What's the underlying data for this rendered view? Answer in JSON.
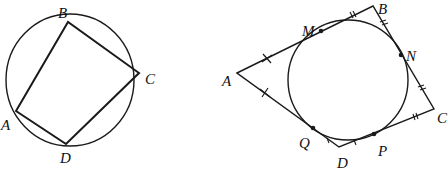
{
  "figures": [
    {
      "name": "cyclic-quadrilateral",
      "description": "Quadrilateral ABCD inscribed in a circle",
      "circle": {
        "cx": 70,
        "cy": 80,
        "rx": 64,
        "ry": 66
      },
      "vertices": {
        "A": {
          "x": 16,
          "y": 111
        },
        "B": {
          "x": 68,
          "y": 22
        },
        "C": {
          "x": 139,
          "y": 73
        },
        "D": {
          "x": 66,
          "y": 144
        }
      },
      "labels": {
        "A": "A",
        "B": "B",
        "C": "C",
        "D": "D"
      }
    },
    {
      "name": "tangential-quadrilateral",
      "description": "Quadrilateral ABCD circumscribed about a circle with tangent points M, N, P, Q; equal tangent segments marked with ticks",
      "circle": {
        "cx": 348,
        "cy": 80,
        "r": 60
      },
      "vertices": {
        "A": {
          "x": 237,
          "y": 73
        },
        "B": {
          "x": 373,
          "y": 6
        },
        "C": {
          "x": 434,
          "y": 109
        },
        "D": {
          "x": 339,
          "y": 147
        }
      },
      "tangent_points": {
        "M": {
          "x": 321,
          "y": 31
        },
        "N": {
          "x": 401,
          "y": 55
        },
        "P": {
          "x": 374,
          "y": 134
        },
        "Q": {
          "x": 313,
          "y": 128
        }
      },
      "labels": {
        "A": "A",
        "B": "B",
        "C": "C",
        "D": "D",
        "M": "M",
        "N": "N",
        "P": "P",
        "Q": "Q"
      },
      "tick_marks": {
        "AM_AQ": "cross",
        "BM_BN": "double-tick",
        "CN_CP": "double-tick",
        "DP_DQ": "single-tick"
      }
    }
  ],
  "colors": {
    "stroke": "#1a1a1a",
    "background": "#ffffff"
  }
}
